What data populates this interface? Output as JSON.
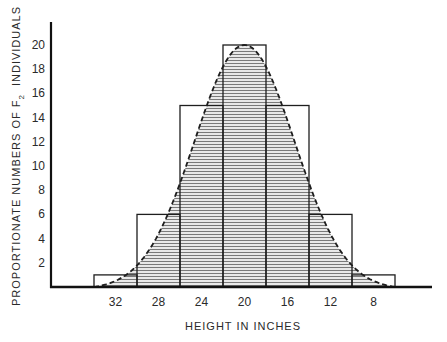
{
  "chart_data": {
    "type": "bar",
    "subtype": "histogram-with-normal-curve",
    "title": "",
    "xlabel": "HEIGHT IN INCHES",
    "ylabel": "PROPORTIONATE NUMBERS OF F2 INDIVIDUALS",
    "ylabel_parts": {
      "main": "PROPORTIONATE NUMBERS OF F",
      "subscript": "2",
      "tail": "INDIVIDUALS"
    },
    "categories": [
      "32",
      "28",
      "24",
      "20",
      "16",
      "12",
      "8"
    ],
    "values": [
      1,
      6,
      15,
      20,
      15,
      6,
      1
    ],
    "yticks": [
      2,
      4,
      6,
      8,
      10,
      12,
      14,
      16,
      18,
      20
    ],
    "ylim": [
      0,
      22
    ],
    "grid": false,
    "legend": null,
    "overlay": {
      "type": "normal-curve",
      "style": "dashed",
      "fill": "horizontal-hatch",
      "peak": 20
    }
  }
}
